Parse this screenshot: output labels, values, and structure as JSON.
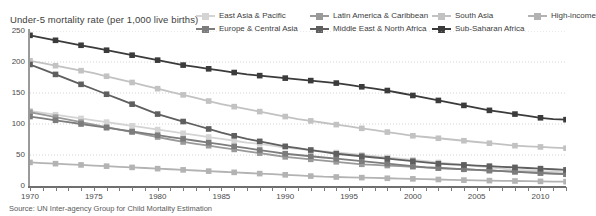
{
  "chart_data": {
    "type": "line",
    "title": "Under-5 mortality rate (per 1,000 live births)",
    "xlabel": "",
    "ylabel": "",
    "source": "Source: UN Inter-agency Group for Child Mortality Estimation",
    "xlim": [
      1970,
      2012
    ],
    "ylim": [
      0,
      250
    ],
    "y_ticks": [
      0,
      50,
      100,
      150,
      200,
      250
    ],
    "y_tick_labels": [
      "0",
      "50",
      "100",
      "150",
      "200",
      "250"
    ],
    "x_ticks": [
      1970,
      1971,
      1972,
      1973,
      1974,
      1975,
      1976,
      1977,
      1978,
      1979,
      1980,
      1981,
      1982,
      1983,
      1984,
      1985,
      1986,
      1987,
      1988,
      1989,
      1990,
      1991,
      1992,
      1993,
      1994,
      1995,
      1996,
      1997,
      1998,
      1999,
      2000,
      2001,
      2002,
      2003,
      2004,
      2005,
      2006,
      2007,
      2008,
      2009,
      2010,
      2011,
      2012
    ],
    "x_tick_labels": [
      "1970",
      "1975",
      "1980",
      "1985",
      "1990",
      "1995",
      "2000",
      "2005",
      "2010"
    ],
    "x_labeled_years": [
      1970,
      1975,
      1980,
      1985,
      1990,
      1995,
      2000,
      2005,
      2010
    ],
    "x": [
      1970,
      1971,
      1972,
      1973,
      1974,
      1975,
      1976,
      1977,
      1978,
      1979,
      1980,
      1981,
      1982,
      1983,
      1984,
      1985,
      1986,
      1987,
      1988,
      1989,
      1990,
      1991,
      1992,
      1993,
      1994,
      1995,
      1996,
      1997,
      1998,
      1999,
      2000,
      2001,
      2002,
      2003,
      2004,
      2005,
      2006,
      2007,
      2008,
      2009,
      2010,
      2011,
      2012
    ],
    "marker": "square",
    "marker_every": 2,
    "grid": "horizontal-dotted",
    "legend_position": "top-right",
    "series": [
      {
        "name": "East Asia & Pacific",
        "color": "#d4d4d4",
        "values": [
          121,
          118,
          115,
          112,
          109,
          106,
          103,
          100,
          97,
          94,
          91,
          88,
          85,
          82,
          79,
          76,
          73,
          70,
          68,
          65,
          62,
          60,
          58,
          56,
          54,
          52,
          50,
          48,
          46,
          44,
          42,
          40,
          38,
          36,
          34,
          32,
          30,
          28,
          26,
          25,
          24,
          23,
          22
        ]
      },
      {
        "name": "Europe & Central Asia",
        "color": "#7c7c7c",
        "values": [
          112,
          109,
          106,
          103,
          100,
          97,
          94,
          91,
          88,
          85,
          82,
          79,
          76,
          73,
          70,
          67,
          64,
          61,
          58,
          55,
          52,
          50,
          48,
          46,
          44,
          42,
          40,
          38,
          36,
          34,
          32,
          30,
          29,
          28,
          27,
          26,
          25,
          24,
          23,
          22,
          21,
          20,
          19
        ]
      },
      {
        "name": "Latin America & Caribbean",
        "color": "#9a9a9a",
        "values": [
          119,
          115,
          111,
          107,
          103,
          99,
          95,
          91,
          87,
          83,
          79,
          75,
          71,
          68,
          65,
          62,
          59,
          56,
          53,
          50,
          47,
          45,
          43,
          41,
          39,
          37,
          35,
          34,
          33,
          32,
          31,
          30,
          29,
          28,
          27,
          26,
          25,
          24,
          23,
          22,
          21,
          20,
          19
        ]
      },
      {
        "name": "Middle East & North Africa",
        "color": "#5f5f5f",
        "values": [
          196,
          188,
          180,
          172,
          164,
          156,
          148,
          140,
          132,
          124,
          116,
          110,
          104,
          98,
          92,
          86,
          81,
          76,
          72,
          68,
          64,
          61,
          58,
          55,
          52,
          50,
          48,
          46,
          44,
          42,
          40,
          38,
          36,
          35,
          34,
          33,
          32,
          31,
          30,
          29,
          28,
          27,
          26
        ]
      },
      {
        "name": "South Asia",
        "color": "#c2c2c2",
        "values": [
          202,
          198,
          194,
          190,
          186,
          182,
          177,
          172,
          167,
          162,
          157,
          152,
          147,
          142,
          137,
          132,
          128,
          124,
          120,
          116,
          112,
          108,
          105,
          102,
          99,
          96,
          93,
          90,
          87,
          84,
          81,
          79,
          77,
          75,
          73,
          71,
          69,
          67,
          65,
          64,
          63,
          62,
          61
        ]
      },
      {
        "name": "Sub-Saharan Africa",
        "color": "#3b3b3b",
        "values": [
          243,
          239,
          235,
          231,
          227,
          223,
          219,
          215,
          211,
          207,
          203,
          199,
          195,
          192,
          189,
          186,
          183,
          180,
          178,
          176,
          174,
          172,
          170,
          168,
          166,
          163,
          160,
          157,
          154,
          150,
          146,
          142,
          138,
          134,
          130,
          126,
          122,
          119,
          116,
          113,
          110,
          108,
          107
        ]
      },
      {
        "name": "High-income",
        "color": "#b3b3b3",
        "values": [
          38,
          37,
          36,
          35,
          34,
          33,
          32,
          31,
          30,
          29,
          28,
          27,
          26,
          25,
          24,
          23,
          22,
          21,
          20,
          19,
          18,
          17,
          16,
          15,
          14.5,
          14,
          13.5,
          13,
          12.5,
          12,
          11.5,
          11,
          10.5,
          10,
          9.5,
          9,
          8.7,
          8.4,
          8.1,
          7.8,
          7.5,
          7.2,
          7
        ]
      }
    ],
    "legend_rows": [
      [
        "East Asia & Pacific",
        "Latin America & Caribbean",
        "South Asia",
        "High-income"
      ],
      [
        "Europe & Central Asia",
        "Middle East & North Africa",
        "Sub-Saharan Africa"
      ]
    ]
  }
}
